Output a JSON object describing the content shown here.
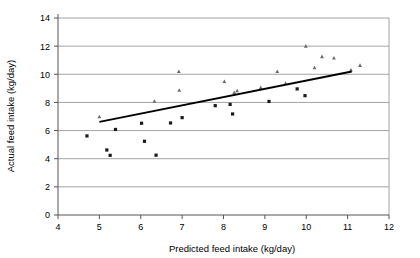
{
  "chart_data": {
    "type": "scatter",
    "title": "",
    "xlabel": "Predicted feed intake (kg/day)",
    "ylabel": "Actual feed intake (kg/day)",
    "xlim": [
      4,
      12
    ],
    "ylim": [
      0,
      14
    ],
    "xticks": [
      4,
      5,
      6,
      7,
      8,
      9,
      10,
      11,
      12
    ],
    "yticks": [
      0,
      2,
      4,
      6,
      8,
      10,
      12,
      14
    ],
    "xtick_labels": [
      "4",
      "5",
      "6",
      "7",
      "8",
      "9",
      "10",
      "11",
      "12"
    ],
    "ytick_labels": [
      "0",
      "2",
      "4",
      "6",
      "8",
      "10",
      "12",
      "14"
    ],
    "grid": "horizontal",
    "legend": "none",
    "series": [
      {
        "name": "square-markers",
        "marker": "square",
        "color": "#1a1a1a",
        "points": [
          {
            "x": 4.7,
            "y": 5.62
          },
          {
            "x": 5.18,
            "y": 4.62
          },
          {
            "x": 5.26,
            "y": 4.24
          },
          {
            "x": 5.39,
            "y": 6.08
          },
          {
            "x": 6.02,
            "y": 6.52
          },
          {
            "x": 6.09,
            "y": 5.24
          },
          {
            "x": 6.37,
            "y": 4.25
          },
          {
            "x": 6.72,
            "y": 6.54
          },
          {
            "x": 7.0,
            "y": 6.92
          },
          {
            "x": 7.8,
            "y": 7.77
          },
          {
            "x": 8.16,
            "y": 7.86
          },
          {
            "x": 8.22,
            "y": 7.18
          },
          {
            "x": 9.1,
            "y": 8.07
          },
          {
            "x": 9.78,
            "y": 8.96
          },
          {
            "x": 9.97,
            "y": 8.48
          }
        ]
      },
      {
        "name": "triangle-markers",
        "marker": "triangle",
        "color": "#6b6b6b",
        "points": [
          {
            "x": 5.0,
            "y": 7.0
          },
          {
            "x": 6.33,
            "y": 8.1
          },
          {
            "x": 6.92,
            "y": 10.22
          },
          {
            "x": 6.93,
            "y": 8.88
          },
          {
            "x": 8.02,
            "y": 9.5
          },
          {
            "x": 8.26,
            "y": 8.72
          },
          {
            "x": 8.33,
            "y": 8.85
          },
          {
            "x": 8.9,
            "y": 9.07
          },
          {
            "x": 9.3,
            "y": 10.22
          },
          {
            "x": 9.5,
            "y": 9.37
          },
          {
            "x": 9.99,
            "y": 12.02
          },
          {
            "x": 10.2,
            "y": 10.48
          },
          {
            "x": 10.38,
            "y": 11.27
          },
          {
            "x": 10.67,
            "y": 11.18
          },
          {
            "x": 11.08,
            "y": 10.32
          },
          {
            "x": 11.3,
            "y": 10.65
          }
        ]
      }
    ],
    "trendline": {
      "name": "regression-line",
      "color": "#000000",
      "x_start": 5.0,
      "y_start": 6.62,
      "x_end": 11.1,
      "y_end": 10.2
    }
  }
}
